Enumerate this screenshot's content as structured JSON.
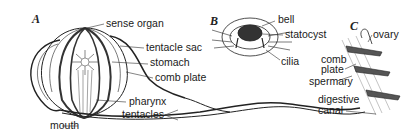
{
  "figure": {
    "panels": [
      {
        "id": "A",
        "label": "A",
        "labels": [
          "sense organ",
          "tentacle sac",
          "stomach",
          "comb plate",
          "pharynx",
          "tentacles",
          "mouth"
        ]
      },
      {
        "id": "B",
        "label": "B",
        "labels": [
          "bell",
          "statocyst",
          "cilia"
        ]
      },
      {
        "id": "C",
        "label": "C",
        "labels": [
          "ovary",
          "comb",
          "plate",
          "spermary",
          "digestive",
          "canal"
        ]
      }
    ]
  }
}
